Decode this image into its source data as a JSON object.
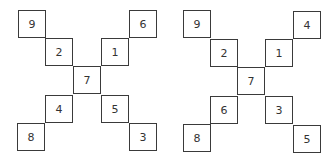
{
  "figures": [
    {
      "name": "left-figure",
      "cells": {
        "top_left_outer": "9",
        "top_left_inner": "2",
        "top_right_inner": "1",
        "top_right_outer": "6",
        "center": "7",
        "bottom_left_inner": "4",
        "bottom_left_outer": "8",
        "bottom_right_inner": "5",
        "bottom_right_outer": "3"
      }
    },
    {
      "name": "right-figure",
      "cells": {
        "top_left_outer": "9",
        "top_left_inner": "2",
        "top_right_inner": "1",
        "top_right_outer": "4",
        "center": "7",
        "bottom_left_inner": "6",
        "bottom_left_outer": "8",
        "bottom_right_inner": "3",
        "bottom_right_outer": "5"
      }
    }
  ],
  "colors": {
    "line": "#3a3a3a",
    "text": "#333333",
    "background": "#ffffff"
  }
}
